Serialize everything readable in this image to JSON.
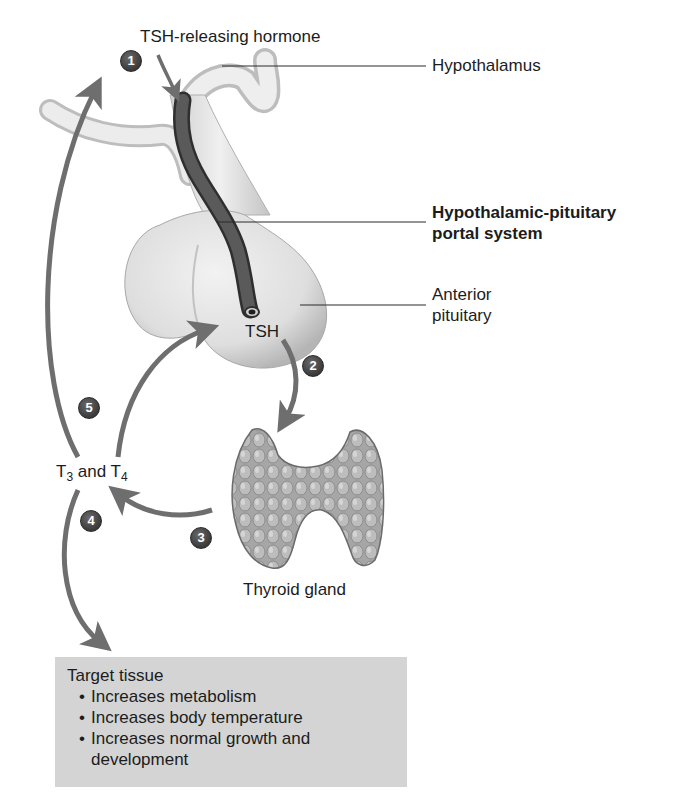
{
  "figure": {
    "labels": {
      "trh": "TSH-releasing hormone",
      "hypothalamus": "Hypothalamus",
      "portal_line1": "Hypothalamic-pituitary",
      "portal_line2": "portal system",
      "anterior_line1": "Anterior",
      "anterior_line2": "pituitary",
      "tsh": "TSH",
      "thyroid": "Thyroid gland",
      "t3": "T",
      "t3_sub": "3",
      "and": " and T",
      "t4_sub": "4"
    },
    "steps": [
      "1",
      "2",
      "3",
      "4",
      "5"
    ],
    "target": {
      "title": "Target tissue",
      "items": [
        "Increases metabolism",
        "Increases body temperature",
        "Increases normal growth and development"
      ]
    },
    "colors": {
      "arrow": "#6e6e6e",
      "badge": "#4a4a4a",
      "portal_vessel": "#4d4d4d",
      "gland": "#e2e2e2",
      "thyroid": "#a9a9a9",
      "target_box": "#d4d4d4"
    }
  }
}
